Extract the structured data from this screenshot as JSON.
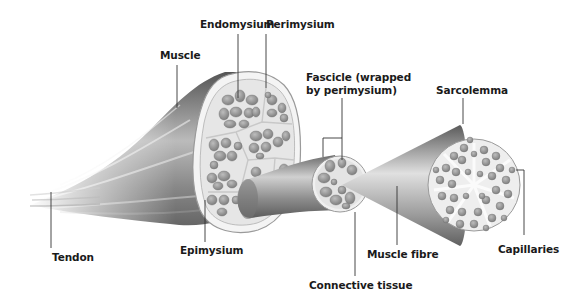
{
  "diagram": {
    "labels": {
      "endomysium": "Endomysium",
      "perimysium": "Perimysium",
      "muscle": "Muscle",
      "fascicle_line1": "Fascicle (wrapped",
      "fascicle_line2": "by perimysium)",
      "sarcolemma": "Sarcolemma",
      "tendon": "Tendon",
      "epimysium": "Epimysium",
      "muscle_fibre": "Muscle fibre",
      "capillaries": "Capillaries",
      "connective_tissue": "Connective tissue"
    },
    "colors": {
      "background": "#ffffff",
      "label_text": "#1a1a1a",
      "leader_line": "#333333",
      "tissue_dark": "#5a5a5a",
      "tissue_mid": "#9a9a9a",
      "tissue_light": "#d8d8d8",
      "cell_fill": "#8c8c8c"
    }
  }
}
